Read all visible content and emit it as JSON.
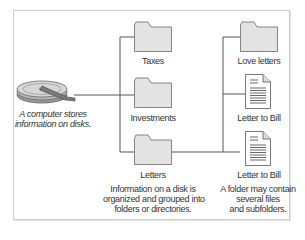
{
  "diagram": {
    "disk": {
      "icon": "hard-disk-icon",
      "caption_line1": "A computer stores",
      "caption_line2": "information on disks."
    },
    "level1_folders": [
      {
        "label": "Taxes",
        "icon": "folder-icon"
      },
      {
        "label": "Investments",
        "icon": "folder-icon"
      },
      {
        "label": "Letters",
        "icon": "folder-icon"
      }
    ],
    "level2_items": [
      {
        "label": "Love letters",
        "icon": "folder-icon"
      },
      {
        "label": "Letter to Bill",
        "icon": "document-icon"
      },
      {
        "label": "Letter to Bill",
        "icon": "document-icon"
      }
    ],
    "middle_caption": {
      "line1": "Information on a disk is",
      "line2": "organized and grouped into",
      "line3": "folders or directories."
    },
    "right_caption": {
      "line1": "A folder may contain",
      "line2": "several files",
      "line3": "and subfolders."
    },
    "colors": {
      "folder_fill": "#e3e3e3",
      "folder_stroke": "#6a6a6a",
      "line": "#555555",
      "frame": "#cfcfcf"
    }
  }
}
